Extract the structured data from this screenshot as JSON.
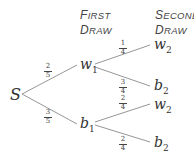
{
  "headers": {
    "first": {
      "line1_cap": "F",
      "line1_rest": "IRST",
      "line2_cap": "D",
      "line2_rest": "RAW"
    },
    "second": {
      "line1_cap": "S",
      "line1_rest": "ECOND",
      "line2_cap": "D",
      "line2_rest": "RAW"
    }
  },
  "nodes": {
    "start": {
      "label": "S",
      "sub": ""
    },
    "w1": {
      "label": "w",
      "sub": "1"
    },
    "b1": {
      "label": "b",
      "sub": "1"
    },
    "w2_top": {
      "label": "w",
      "sub": "2"
    },
    "b2_top": {
      "label": "b",
      "sub": "2"
    },
    "w2_bottom": {
      "label": "w",
      "sub": "2"
    },
    "b2_bottom": {
      "label": "b",
      "sub": "2"
    }
  },
  "probabilities": {
    "s_w1": {
      "num": "2",
      "den": "5"
    },
    "s_b1": {
      "num": "3",
      "den": "5"
    },
    "w1_w2": {
      "num": "1",
      "den": "4"
    },
    "w1_b2": {
      "num": "3",
      "den": "4"
    },
    "b1_w2": {
      "num": "2",
      "den": "4"
    },
    "b1_b2": {
      "num": "2",
      "den": "4"
    }
  },
  "colors": {
    "line": "#8a8a8a",
    "text": "#333333"
  }
}
